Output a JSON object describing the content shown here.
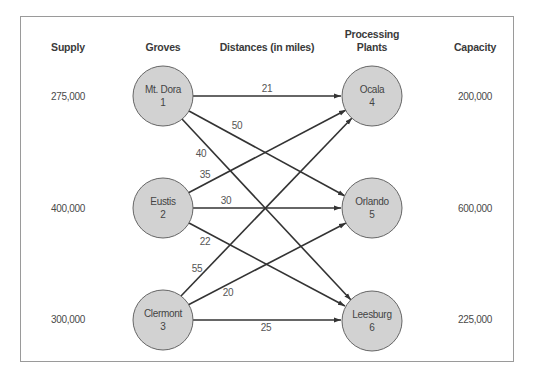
{
  "headers": {
    "supply": "Supply",
    "groves": "Groves",
    "distances": "Distances (in miles)",
    "plants_line1": "Processing",
    "plants_line2": "Plants",
    "capacity": "Capacity"
  },
  "groves": [
    {
      "name": "Mt. Dora",
      "id": "1",
      "supply": "275,000"
    },
    {
      "name": "Eustis",
      "id": "2",
      "supply": "400,000"
    },
    {
      "name": "Clermont",
      "id": "3",
      "supply": "300,000"
    }
  ],
  "plants": [
    {
      "name": "Ocala",
      "id": "4",
      "capacity": "200,000"
    },
    {
      "name": "Orlando",
      "id": "5",
      "capacity": "600,000"
    },
    {
      "name": "Leesburg",
      "id": "6",
      "capacity": "225,000"
    }
  ],
  "edges": [
    {
      "from": "1",
      "to": "4",
      "distance": "21"
    },
    {
      "from": "1",
      "to": "5",
      "distance": "50"
    },
    {
      "from": "1",
      "to": "6",
      "distance": "40"
    },
    {
      "from": "2",
      "to": "4",
      "distance": "35"
    },
    {
      "from": "2",
      "to": "5",
      "distance": "30"
    },
    {
      "from": "2",
      "to": "6",
      "distance": "22"
    },
    {
      "from": "3",
      "to": "4",
      "distance": "55"
    },
    {
      "from": "3",
      "to": "5",
      "distance": "20"
    },
    {
      "from": "3",
      "to": "6",
      "distance": "25"
    }
  ],
  "colors": {
    "node_fill": "#d2d2d2",
    "node_stroke": "#666666",
    "edge": "#333333",
    "border": "#999999"
  }
}
